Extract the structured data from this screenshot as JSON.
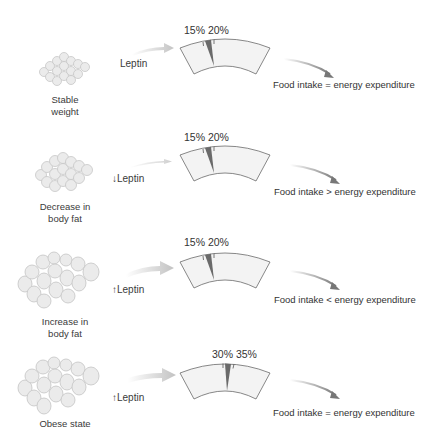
{
  "colors": {
    "gauge_fill": "#f2f2f2",
    "gauge_stroke": "#666666",
    "needle": "#6a6a6a",
    "arrow_gray": "#c8c8c8",
    "outcome_arrow": "#808080",
    "cell_fill": "#e9e9e9",
    "cell_stroke": "#c4c4c4"
  },
  "rows": [
    {
      "state_label": "Stable weight",
      "state_label_lines": [
        "Stable",
        "weight"
      ],
      "leptin_label": "Leptin",
      "leptin_direction": "none",
      "leptin_arrow_icon": "",
      "gauge_labels": "15% 20%",
      "gauge_low": 15,
      "gauge_high": 20,
      "outcome": "Food intake = energy expenditure"
    },
    {
      "state_label": "Decrease in body fat",
      "state_label_lines": [
        "Decrease in",
        "body fat"
      ],
      "leptin_label": "Leptin",
      "leptin_direction": "down",
      "leptin_arrow_icon": "↓",
      "gauge_labels": "15% 20%",
      "gauge_low": 15,
      "gauge_high": 20,
      "outcome": "Food intake > energy expenditure"
    },
    {
      "state_label": "Increase in body fat",
      "state_label_lines": [
        "Increase in",
        "body fat"
      ],
      "leptin_label": "Leptin",
      "leptin_direction": "up",
      "leptin_arrow_icon": "↑",
      "gauge_labels": "15% 20%",
      "gauge_low": 15,
      "gauge_high": 20,
      "outcome": "Food intake < energy expenditure"
    },
    {
      "state_label": "Obese state",
      "state_label_lines": [
        "Obese state"
      ],
      "leptin_label": "Leptin",
      "leptin_direction": "up",
      "leptin_arrow_icon": "↑",
      "gauge_labels": "30% 35%",
      "gauge_low": 30,
      "gauge_high": 35,
      "outcome": "Food intake = energy expenditure"
    }
  ]
}
